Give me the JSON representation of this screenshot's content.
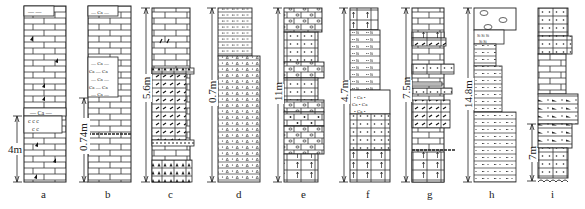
{
  "figure": {
    "columns": [
      {
        "id": "a",
        "label": "a",
        "scale": "4m",
        "lithology": [
          "limestone",
          "limestone with fossils",
          "marly limestone (Ca)",
          "dolomitic (c) beds"
        ]
      },
      {
        "id": "b",
        "label": "b",
        "scale": "0.74m",
        "lithology": [
          "limestone",
          "calcareous shale (Ca)"
        ]
      },
      {
        "id": "c",
        "label": "c",
        "scale": "5.6m",
        "lithology": [
          "limestone",
          "bioclastic limestone",
          "argillaceous limestone with breccia"
        ]
      },
      {
        "id": "d",
        "label": "d",
        "scale": "0.7m",
        "lithology": [
          "silty shale",
          "tuffaceous sandstone"
        ]
      },
      {
        "id": "e",
        "label": "e",
        "scale": "11m",
        "lithology": [
          "oolitic limestone",
          "sandy limestone",
          "dolomite"
        ]
      },
      {
        "id": "f",
        "label": "f",
        "scale": "4.7m",
        "lithology": [
          "dolomite",
          "siliceous shale (Si)",
          "calcareous sandstone (Ca)"
        ]
      },
      {
        "id": "g",
        "label": "g",
        "scale": "7.5m",
        "lithology": [
          "limestone",
          "bioclastic limestone",
          "sandy limestone",
          "dolomite"
        ]
      },
      {
        "id": "h",
        "label": "h",
        "scale": "14.8m",
        "lithology": [
          "siliceous nodule (Si)",
          "siltstone",
          "silty mudstone"
        ]
      },
      {
        "id": "i",
        "label": "i",
        "scale": "7m",
        "lithology": [
          "sandy limestone",
          "limestone",
          "fossiliferous sandstone",
          "conglomerate"
        ]
      }
    ]
  }
}
